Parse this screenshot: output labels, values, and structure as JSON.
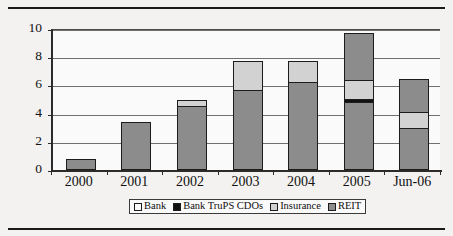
{
  "figure": {
    "background_color": "#f3f2f0",
    "plot_background_color": "#fbfafa"
  },
  "chart_data": {
    "type": "bar",
    "stacked": true,
    "title": "",
    "subtitle": "",
    "xlabel": "",
    "ylabel": "$ billions",
    "categories": [
      "2000",
      "2001",
      "2002",
      "2003",
      "2004",
      "2005",
      "Jun-06"
    ],
    "ylim": [
      0,
      10
    ],
    "yticks": [
      0,
      2,
      4,
      6,
      8,
      10
    ],
    "ytick_labels": [
      "0",
      "2",
      "4",
      "6",
      "8",
      "10"
    ],
    "grid": true,
    "grid_axis": "y",
    "legend_position": "bottom",
    "legend_entries": [
      "Bank",
      "Bank TruPS CDOs",
      "Insurance",
      "REIT"
    ],
    "series": [
      {
        "name": "Bank",
        "color": "#fbfafa",
        "values": [
          0,
          0,
          0,
          0,
          0,
          0,
          0
        ]
      },
      {
        "name": "Bank TruPS CDOs",
        "color": "#111111",
        "values": [
          0,
          0,
          0,
          0,
          0,
          0.2,
          0
        ]
      },
      {
        "name": "Insurance",
        "color": "#d2d2d2",
        "values": [
          0,
          0,
          0.4,
          2.05,
          1.45,
          1.35,
          1.15
        ]
      },
      {
        "name": "REIT",
        "color": "#8c8c8c",
        "values": [
          0.75,
          3.4,
          4.55,
          5.7,
          6.25,
          8.2,
          5.3
        ]
      }
    ],
    "stack_order_bottom_to_top": [
      "REIT",
      "Bank TruPS CDOs",
      "Insurance",
      "REIT"
    ],
    "bar_stacks": [
      {
        "category": "2000",
        "total": 0.75,
        "segments": [
          {
            "series": "REIT",
            "value": 0.75,
            "from": 0.0,
            "to": 0.75
          }
        ]
      },
      {
        "category": "2001",
        "total": 3.4,
        "segments": [
          {
            "series": "REIT",
            "value": 3.4,
            "from": 0.0,
            "to": 3.4
          }
        ]
      },
      {
        "category": "2002",
        "total": 4.95,
        "segments": [
          {
            "series": "REIT",
            "value": 4.55,
            "from": 0.0,
            "to": 4.55
          },
          {
            "series": "Insurance",
            "value": 0.4,
            "from": 4.55,
            "to": 4.95
          }
        ]
      },
      {
        "category": "2003",
        "total": 7.75,
        "segments": [
          {
            "series": "REIT",
            "value": 5.7,
            "from": 0.0,
            "to": 5.7
          },
          {
            "series": "Insurance",
            "value": 2.05,
            "from": 5.7,
            "to": 7.75
          }
        ]
      },
      {
        "category": "2004",
        "total": 7.7,
        "segments": [
          {
            "series": "REIT",
            "value": 6.25,
            "from": 0.0,
            "to": 6.25
          },
          {
            "series": "Insurance",
            "value": 1.45,
            "from": 6.25,
            "to": 7.7
          }
        ]
      },
      {
        "category": "2005",
        "total": 9.75,
        "segments": [
          {
            "series": "REIT",
            "value": 4.85,
            "from": 0.0,
            "to": 4.85
          },
          {
            "series": "Bank TruPS CDOs",
            "value": 0.2,
            "from": 4.85,
            "to": 5.05
          },
          {
            "series": "Insurance",
            "value": 1.35,
            "from": 5.05,
            "to": 6.4
          },
          {
            "series": "REIT",
            "value": 3.35,
            "from": 6.4,
            "to": 9.75
          }
        ]
      },
      {
        "category": "Jun-06",
        "total": 6.45,
        "segments": [
          {
            "series": "REIT",
            "value": 2.95,
            "from": 0.0,
            "to": 2.95
          },
          {
            "series": "Insurance",
            "value": 1.15,
            "from": 2.95,
            "to": 4.1
          },
          {
            "series": "REIT",
            "value": 2.35,
            "from": 4.1,
            "to": 6.45
          }
        ]
      }
    ]
  }
}
